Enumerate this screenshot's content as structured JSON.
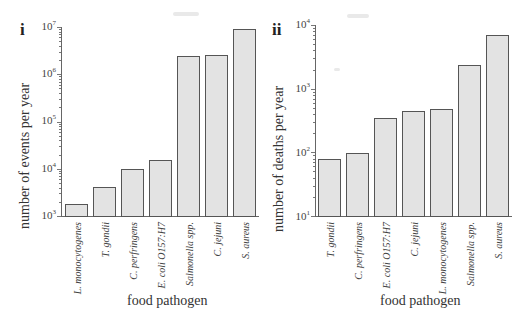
{
  "chart_data": [
    {
      "type": "bar",
      "panel": "i",
      "title": "",
      "xlabel": "food pathogen",
      "ylabel": "number of events per year",
      "yscale": "log",
      "ylim": [
        1000,
        10000000
      ],
      "yticks": [
        "10^3",
        "10^4",
        "10^5",
        "10^6",
        "10^7"
      ],
      "grid": false,
      "legend": null,
      "categories": [
        "L. monocytogenes",
        "T. gondii",
        "C. perfringens",
        "E. coli O157:H7",
        "Salmonella spp.",
        "C. jejuni",
        "S. aureus"
      ],
      "values": [
        1800,
        4100,
        10000,
        15000,
        2400000,
        2500000,
        8900000
      ]
    },
    {
      "type": "bar",
      "panel": "ii",
      "title": "",
      "xlabel": "food pathogen",
      "ylabel": "number of deaths per year",
      "yscale": "log",
      "ylim": [
        10,
        10000
      ],
      "yticks": [
        "10^1",
        "10^2",
        "10^3",
        "10^4"
      ],
      "grid": false,
      "legend": null,
      "categories": [
        "T. gondii",
        "C. perfringens",
        "E. coli O157:H7",
        "C. jejuni",
        "L. monocytogenes",
        "Salmonella spp.",
        "S. aureus"
      ],
      "values": [
        80,
        100,
        350,
        450,
        480,
        2400,
        7000
      ]
    }
  ],
  "panels": {
    "i": {
      "label": "i",
      "ylabel": "number of events per year",
      "xlabel": "food pathogen",
      "ticks": [
        {
          "base": "10",
          "exp": "7"
        },
        {
          "base": "10",
          "exp": "6"
        },
        {
          "base": "10",
          "exp": "5"
        },
        {
          "base": "10",
          "exp": "4"
        },
        {
          "base": "10",
          "exp": "3"
        }
      ],
      "categories": [
        "L. monocytogenes",
        "T. gondii",
        "C. perfringens",
        "E. coli O157:H7",
        "Salmonella spp.",
        "C. jejuni",
        "S. aureus"
      ]
    },
    "ii": {
      "label": "ii",
      "ylabel": "number of deaths per year",
      "xlabel": "food pathogen",
      "ticks": [
        {
          "base": "10",
          "exp": "4"
        },
        {
          "base": "10",
          "exp": "3"
        },
        {
          "base": "10",
          "exp": "2"
        },
        {
          "base": "10",
          "exp": "1"
        }
      ],
      "categories": [
        "T. gondii",
        "C. perfringens",
        "E. coli O157:H7",
        "C. jejuni",
        "L. monocytogenes",
        "Salmonella spp.",
        "S. aureus"
      ]
    }
  }
}
